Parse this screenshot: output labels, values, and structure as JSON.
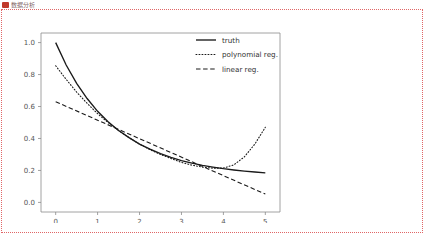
{
  "header": {
    "title": "数据分析",
    "icon": "app-icon"
  },
  "chart_data": {
    "type": "line",
    "title": "",
    "xlabel": "",
    "ylabel": "",
    "xlim": [
      -0.35,
      5.35
    ],
    "ylim": [
      -0.06,
      1.06
    ],
    "xticks": [
      "0",
      "1",
      "2",
      "3",
      "4",
      "5"
    ],
    "yticks": [
      "0.0",
      "0.2",
      "0.4",
      "0.6",
      "0.8",
      "1.0"
    ],
    "xtick_values": [
      0,
      1,
      2,
      3,
      4,
      5
    ],
    "ytick_values": [
      0.0,
      0.2,
      0.4,
      0.6,
      0.8,
      1.0
    ],
    "grid": false,
    "legend_position": "upper right",
    "legend": [
      "truth",
      "polynomial reg.",
      "linear reg."
    ],
    "series": [
      {
        "name": "truth",
        "style": "solid",
        "color": "#1a1a1a",
        "x": [
          0,
          0.25,
          0.5,
          0.75,
          1,
          1.25,
          1.5,
          1.75,
          2,
          2.25,
          2.5,
          2.75,
          3,
          3.25,
          3.5,
          3.75,
          4,
          4.25,
          4.5,
          4.75,
          5
        ],
        "y": [
          1.0,
          0.86,
          0.745,
          0.65,
          0.57,
          0.505,
          0.45,
          0.405,
          0.365,
          0.333,
          0.305,
          0.282,
          0.262,
          0.246,
          0.232,
          0.221,
          0.211,
          0.203,
          0.196,
          0.19,
          0.185
        ]
      },
      {
        "name": "polynomial reg.",
        "style": "dotted",
        "color": "#1a1a1a",
        "x": [
          0,
          0.25,
          0.5,
          0.75,
          1,
          1.25,
          1.5,
          1.75,
          2,
          2.25,
          2.5,
          2.75,
          3,
          3.25,
          3.5,
          3.75,
          4,
          4.25,
          4.5,
          4.75,
          5
        ],
        "y": [
          0.855,
          0.77,
          0.69,
          0.62,
          0.555,
          0.5,
          0.45,
          0.405,
          0.365,
          0.33,
          0.3,
          0.275,
          0.25,
          0.233,
          0.221,
          0.214,
          0.215,
          0.235,
          0.285,
          0.365,
          0.47
        ]
      },
      {
        "name": "linear reg.",
        "style": "dashed",
        "color": "#1a1a1a",
        "x": [
          0,
          5
        ],
        "y": [
          0.63,
          0.052
        ]
      }
    ]
  }
}
